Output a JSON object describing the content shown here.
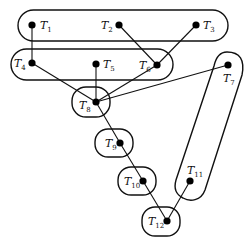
{
  "diagram": {
    "type": "task-graph-with-groupings",
    "nodes": [
      {
        "id": "T1",
        "base": "T",
        "sub": "1",
        "x": 32,
        "y": 25,
        "lx": 40,
        "ly": 29
      },
      {
        "id": "T2",
        "base": "T",
        "sub": "2",
        "x": 119,
        "y": 25,
        "lx": 101,
        "ly": 29
      },
      {
        "id": "T3",
        "base": "T",
        "sub": "3",
        "x": 196,
        "y": 25,
        "lx": 203,
        "ly": 29
      },
      {
        "id": "T4",
        "base": "T",
        "sub": "4",
        "x": 32,
        "y": 63,
        "lx": 14,
        "ly": 67
      },
      {
        "id": "T5",
        "base": "T",
        "sub": "5",
        "x": 96,
        "y": 64,
        "lx": 103,
        "ly": 68
      },
      {
        "id": "T6",
        "base": "T",
        "sub": "6",
        "x": 157,
        "y": 65,
        "lx": 139,
        "ly": 69
      },
      {
        "id": "T7",
        "base": "T",
        "sub": "7",
        "x": 228,
        "y": 65,
        "lx": 223,
        "ly": 82
      },
      {
        "id": "T8",
        "base": "T",
        "sub": "8",
        "x": 96,
        "y": 102,
        "lx": 79,
        "ly": 109
      },
      {
        "id": "T9",
        "base": "T",
        "sub": "9",
        "x": 120,
        "y": 143,
        "lx": 105,
        "ly": 147
      },
      {
        "id": "T10",
        "base": "T",
        "sub": "10",
        "x": 143,
        "y": 181,
        "lx": 124,
        "ly": 185
      },
      {
        "id": "T11",
        "base": "T",
        "sub": "11",
        "x": 190,
        "y": 181,
        "lx": 187,
        "ly": 174
      },
      {
        "id": "T12",
        "base": "T",
        "sub": "12",
        "x": 167,
        "y": 221,
        "lx": 148,
        "ly": 225
      }
    ],
    "edges": [
      [
        "T1",
        "T4"
      ],
      [
        "T2",
        "T6"
      ],
      [
        "T3",
        "T6"
      ],
      [
        "T4",
        "T8"
      ],
      [
        "T5",
        "T8"
      ],
      [
        "T6",
        "T8"
      ],
      [
        "T7",
        "T8"
      ],
      [
        "T8",
        "T9"
      ],
      [
        "T9",
        "T10"
      ],
      [
        "T10",
        "T12"
      ],
      [
        "T11",
        "T12"
      ]
    ],
    "groups": [
      {
        "name": "group-t1-t2-t3",
        "members": [
          "T1",
          "T2",
          "T3"
        ],
        "shape": "rect",
        "x": 18,
        "y": 10,
        "w": 210,
        "h": 31,
        "r": 15.5
      },
      {
        "name": "group-t4-t5-t6",
        "members": [
          "T4",
          "T5",
          "T6"
        ],
        "shape": "rect",
        "x": 11,
        "y": 49,
        "w": 162,
        "h": 31,
        "r": 15.5
      },
      {
        "name": "group-t8",
        "members": [
          "T8"
        ],
        "shape": "rect",
        "x": 72,
        "y": 87,
        "w": 38,
        "h": 30,
        "r": 14
      },
      {
        "name": "group-t9",
        "members": [
          "T9"
        ],
        "shape": "rect",
        "x": 95,
        "y": 129,
        "w": 38,
        "h": 28,
        "r": 13
      },
      {
        "name": "group-t10",
        "members": [
          "T10"
        ],
        "shape": "rect",
        "x": 118,
        "y": 167,
        "w": 38,
        "h": 28,
        "r": 13
      },
      {
        "name": "group-t12",
        "members": [
          "T12"
        ],
        "shape": "rect",
        "x": 142,
        "y": 207,
        "w": 38,
        "h": 29,
        "r": 13
      },
      {
        "name": "group-t7-t11",
        "members": [
          "T7",
          "T11"
        ],
        "shape": "path",
        "d": "M 227 52 C 240 52, 245 60, 242 75 L 205 190 C 201 201, 190 202, 183 198 C 175 194, 174 187, 176 180 L 214 66 C 216 57, 220 52, 227 52 Z"
      }
    ],
    "colors": {
      "stroke": "#111111",
      "node": "#000000",
      "background": "#ffffff"
    }
  }
}
